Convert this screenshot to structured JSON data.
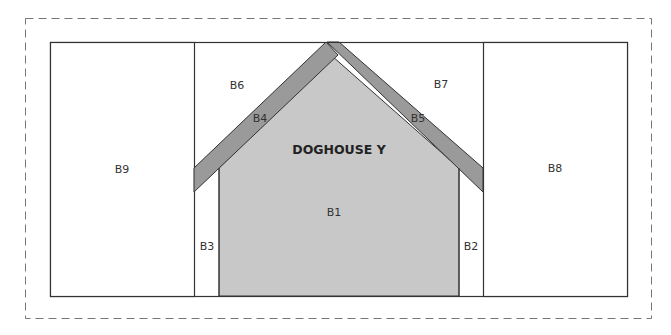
{
  "diagram": {
    "title": "DOGHOUSE Y",
    "colors": {
      "body_fill": "#c8c8c8",
      "roof_fill": "#9a9a9a",
      "outline": "#333333",
      "dash": "#777777",
      "background": "#ffffff"
    },
    "pieces": [
      {
        "id": "B1",
        "label": "B1",
        "desc": "house body"
      },
      {
        "id": "B2",
        "label": "B2",
        "desc": "right side strip"
      },
      {
        "id": "B3",
        "label": "B3",
        "desc": "left side strip"
      },
      {
        "id": "B4",
        "label": "B4",
        "desc": "left roof"
      },
      {
        "id": "B5",
        "label": "B5",
        "desc": "right roof"
      },
      {
        "id": "B6",
        "label": "B6",
        "desc": "upper left background"
      },
      {
        "id": "B7",
        "label": "B7",
        "desc": "upper right background"
      },
      {
        "id": "B8",
        "label": "B8",
        "desc": "right panel"
      },
      {
        "id": "B9",
        "label": "B9",
        "desc": "left panel"
      }
    ]
  }
}
